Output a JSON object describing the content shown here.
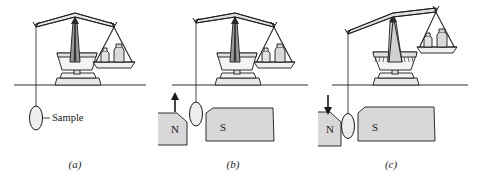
{
  "figure": {
    "type": "gouy-balance-diagram",
    "background_color": "#ffffff",
    "stroke_color": "#1a1a1a",
    "magnet_fill": "#d8d8d8",
    "metal_fill": "#e8e8e8",
    "shadow_fill": "#bdbdbd"
  },
  "panels": [
    {
      "id": "a",
      "caption": "(a)",
      "annotation_label": "Sample",
      "beam_state": "level",
      "has_magnets": false,
      "arrow": "none",
      "weights_count": 2
    },
    {
      "id": "b",
      "caption": "(b)",
      "annotation_label": "",
      "beam_state": "level",
      "has_magnets": true,
      "arrow": "up",
      "arrow_direction_label": "up",
      "pole_left": "N",
      "pole_right": "S",
      "weights_count": 2
    },
    {
      "id": "c",
      "caption": "(c)",
      "annotation_label": "",
      "beam_state": "tilted-right-up",
      "has_magnets": true,
      "arrow": "down",
      "arrow_direction_label": "down",
      "pole_left": "N",
      "pole_right": "S",
      "weights_count": 2
    }
  ]
}
